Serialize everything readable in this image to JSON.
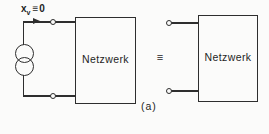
{
  "diagram": {
    "source_label": {
      "variable": "x",
      "subscript": "v",
      "relation": "≡",
      "value": "0"
    },
    "left_network_label": "Netzwerk",
    "right_network_label": "Netzwerk",
    "equivalence_symbol": "≡",
    "caption": "(a)",
    "icons": {
      "current_source": "current-source-icon",
      "direction_arrow": "arrow-right-icon",
      "terminals": "open-circle-terminal"
    },
    "colors": {
      "line": "#2e2e2e",
      "background": "#fbfbfa",
      "text": "#1e1e1e"
    }
  }
}
